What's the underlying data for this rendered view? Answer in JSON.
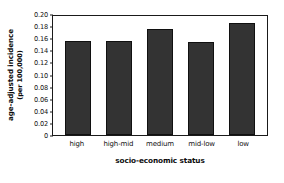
{
  "chart_data": {
    "type": "bar",
    "title": "",
    "categories": [
      "high",
      "high-mid",
      "medium",
      "mid-low",
      "low"
    ],
    "values": [
      0.156,
      0.155,
      0.175,
      0.153,
      0.185
    ],
    "series": [
      {
        "name": "age-adjusted incidence",
        "values": [
          0.156,
          0.155,
          0.175,
          0.153,
          0.185
        ]
      }
    ],
    "xlabel": "socio-economic status",
    "ylabel_line1": "age-adjusted incidence",
    "ylabel_line2": "(per 100,000)",
    "ylim": [
      0,
      0.2
    ],
    "yticks": [
      "0",
      "0.02",
      "0.04",
      "0.06",
      "0.08",
      "0.10",
      "0.12",
      "0.14",
      "0.16",
      "0.18",
      "0.20"
    ],
    "ytick_values": [
      0,
      0.02,
      0.04,
      0.06,
      0.08,
      0.1,
      0.12,
      0.14,
      0.16,
      0.18,
      0.2
    ],
    "grid": false,
    "legend": "none",
    "bar_color": "#333333",
    "axis_color": "#1a1a1a",
    "background": "#ffffff"
  }
}
